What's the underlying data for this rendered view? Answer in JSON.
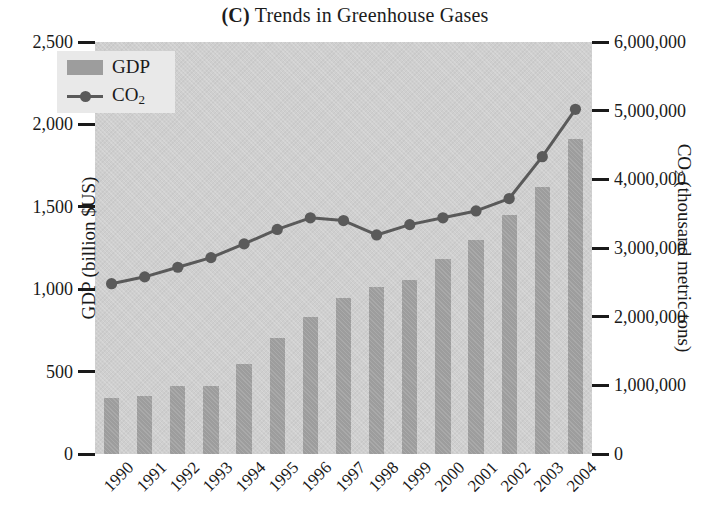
{
  "title": {
    "panel_letter": "(C)",
    "text": " Trends in Greenhouse Gases"
  },
  "legend": {
    "position": "top-left-inside",
    "items": [
      {
        "label": "GDP",
        "label_sub": "",
        "marker": "bar-swatch",
        "color": "#9d9d9d"
      },
      {
        "label": "CO",
        "label_sub": "2",
        "marker": "line-with-dot",
        "color": "#5a5a5a"
      }
    ]
  },
  "axes": {
    "y_left": {
      "title_main": "GDP (billion $US)",
      "title_sub": "",
      "ticks": [
        "0",
        "500",
        "1,000",
        "1,500",
        "2,000",
        "2,500"
      ],
      "tick_values": [
        0,
        500,
        1000,
        1500,
        2000,
        2500
      ],
      "min": 0,
      "max": 2500
    },
    "y_right": {
      "title_main": "CO",
      "title_sub": "2",
      "title_tail": " (thousand metric tons)",
      "ticks": [
        "0",
        "1,000,000",
        "2,000,000",
        "3,000,000",
        "4,000,000",
        "5,000,000",
        "6,000,000"
      ],
      "tick_values": [
        0,
        1000000,
        2000000,
        3000000,
        4000000,
        5000000,
        6000000
      ],
      "min": 0,
      "max": 6000000
    },
    "x": {
      "title": "",
      "ticks": [
        "1990",
        "1991",
        "1992",
        "1993",
        "1994",
        "1995",
        "1996",
        "1997",
        "1998",
        "1999",
        "2000",
        "2001",
        "2002",
        "2003",
        "2004"
      ]
    }
  },
  "chart_data": {
    "type": "bar",
    "title": "(C) Trends in Greenhouse Gases",
    "xlabel": "",
    "ylabel": "GDP (billion $US)",
    "y2label": "CO2 (thousand metric tons)",
    "ylim": [
      0,
      2500
    ],
    "y2lim": [
      0,
      6000000
    ],
    "grid": false,
    "legend_position": "upper left",
    "categories": [
      "1990",
      "1991",
      "1992",
      "1993",
      "1994",
      "1995",
      "1996",
      "1997",
      "1998",
      "1999",
      "2000",
      "2001",
      "2002",
      "2003",
      "2004"
    ],
    "series": [
      {
        "name": "GDP",
        "type": "bar",
        "axis": "left",
        "unit": "billion $US",
        "color": "#9d9d9d",
        "values": [
          340,
          350,
          410,
          415,
          545,
          705,
          830,
          945,
          1015,
          1055,
          1185,
          1300,
          1450,
          1620,
          1910
        ]
      },
      {
        "name": "CO2",
        "type": "line",
        "axis": "right",
        "unit": "thousand metric tons",
        "color": "#5a5a5a",
        "marker": "circle",
        "values": [
          2480000,
          2580000,
          2720000,
          2860000,
          3060000,
          3270000,
          3440000,
          3400000,
          3190000,
          3340000,
          3440000,
          3540000,
          3720000,
          4330000,
          5020000
        ]
      }
    ]
  },
  "colors": {
    "plot_background": "#cfcfcf",
    "bar_fill": "#9d9d9d",
    "line_stroke": "#5a5a5a",
    "legend_background": "#e9e9e9",
    "text": "#1a1a1a",
    "page_background": "#ffffff"
  }
}
